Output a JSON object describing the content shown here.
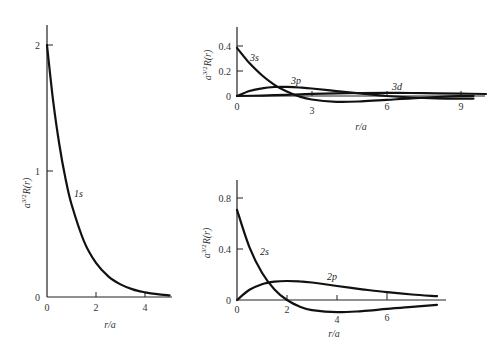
{
  "chart_data": [
    {
      "type": "line",
      "title": "",
      "xlabel": "r/a",
      "ylabel": "a^{3/2}R(r)",
      "xlim": [
        0,
        5.1
      ],
      "ylim": [
        0,
        2.2
      ],
      "xticks": [
        0,
        2,
        4
      ],
      "yticks": [
        0,
        1,
        2
      ],
      "grid": false,
      "series": [
        {
          "name": "1s",
          "x": [
            0,
            0.25,
            0.5,
            0.75,
            1,
            1.5,
            2,
            2.5,
            3,
            3.5,
            4,
            4.5,
            5
          ],
          "values": [
            2.0,
            1.558,
            1.213,
            0.945,
            0.736,
            0.446,
            0.271,
            0.164,
            0.1,
            0.06,
            0.037,
            0.022,
            0.013
          ]
        }
      ],
      "annotations": [
        {
          "text": "1s",
          "x": 1.2,
          "y": 0.78
        }
      ]
    },
    {
      "type": "line",
      "title": "",
      "xlabel": "r/a",
      "ylabel": "a^{3/2}R(r)",
      "xlim": [
        0,
        10
      ],
      "ylim": [
        -0.04,
        0.55
      ],
      "xticks": [
        0,
        3,
        6,
        9
      ],
      "yticks": [
        0,
        0.2,
        0.4
      ],
      "grid": false,
      "series": [
        {
          "name": "3s",
          "x": [
            0,
            0.5,
            1,
            1.5,
            2,
            2.5,
            3,
            4,
            5,
            6,
            7,
            8,
            9,
            9.5
          ],
          "values": [
            0.385,
            0.263,
            0.166,
            0.09,
            0.035,
            -0.004,
            -0.028,
            -0.046,
            -0.043,
            -0.031,
            -0.018,
            -0.008,
            -0.001,
            0.001
          ]
        },
        {
          "name": "3p",
          "x": [
            0,
            0.5,
            1,
            1.5,
            2,
            2.5,
            3,
            4,
            5,
            6,
            7,
            8,
            9,
            9.5
          ],
          "values": [
            0,
            0.04,
            0.062,
            0.072,
            0.073,
            0.068,
            0.06,
            0.039,
            0.019,
            0.0,
            -0.012,
            -0.019,
            -0.021,
            -0.021
          ]
        },
        {
          "name": "3d",
          "x": [
            0,
            1,
            2,
            3,
            4,
            5,
            6,
            7,
            8,
            9,
            10
          ],
          "values": [
            0,
            0.0033,
            0.01,
            0.0167,
            0.0213,
            0.024,
            0.0246,
            0.0236,
            0.0216,
            0.0189,
            0.0161
          ]
        }
      ],
      "annotations": [
        {
          "text": "3s",
          "x": 0.8,
          "y": 0.34
        },
        {
          "text": "3p",
          "x": 2.2,
          "y": 0.1
        },
        {
          "text": "3d",
          "x": 6.3,
          "y": 0.04
        }
      ]
    },
    {
      "type": "line",
      "title": "",
      "xlabel": "r/a",
      "ylabel": "a^{3/2}R(r)",
      "xlim": [
        0,
        8.4
      ],
      "ylim": [
        -0.1,
        0.95
      ],
      "xticks": [
        0,
        2,
        4,
        6
      ],
      "yticks": [
        0,
        0.4,
        0.8
      ],
      "grid": false,
      "series": [
        {
          "name": "2s",
          "x": [
            0,
            0.5,
            1,
            1.5,
            2,
            2.5,
            3,
            4,
            5,
            6,
            7,
            8
          ],
          "values": [
            0.707,
            0.413,
            0.214,
            0.083,
            0,
            -0.051,
            -0.079,
            -0.096,
            -0.087,
            -0.07,
            -0.053,
            -0.038
          ]
        },
        {
          "name": "2p",
          "x": [
            0,
            0.5,
            1,
            1.5,
            2,
            2.5,
            3,
            4,
            5,
            6,
            7,
            8
          ],
          "values": [
            0,
            0.08,
            0.124,
            0.144,
            0.149,
            0.146,
            0.137,
            0.11,
            0.084,
            0.061,
            0.043,
            0.03
          ]
        }
      ],
      "annotations": [
        {
          "text": "2s",
          "x": 1.6,
          "y": 0.4
        },
        {
          "text": "2p",
          "x": 3.6,
          "y": 0.18
        }
      ]
    }
  ],
  "labels": {
    "ylabel_main": "a",
    "ylabel_sup": "3/2",
    "ylabel_rest": "R(r)",
    "xlabel": "r/a",
    "p1_ticks_x": [
      "0",
      "2",
      "4"
    ],
    "p1_ticks_y": [
      "0",
      "1",
      "2"
    ],
    "p2_ticks_x": [
      "0",
      "3",
      "6",
      "9"
    ],
    "p2_ticks_y": [
      "0",
      "0.2",
      "0.4"
    ],
    "p3_ticks_x": [
      "0",
      "2",
      "4",
      "6"
    ],
    "p3_ticks_y": [
      "0",
      "0.4",
      "0.8"
    ],
    "curve_1s": "1s",
    "curve_3s": "3s",
    "curve_3p": "3p",
    "curve_3d": "3d",
    "curve_2s": "2s",
    "curve_2p": "2p"
  }
}
